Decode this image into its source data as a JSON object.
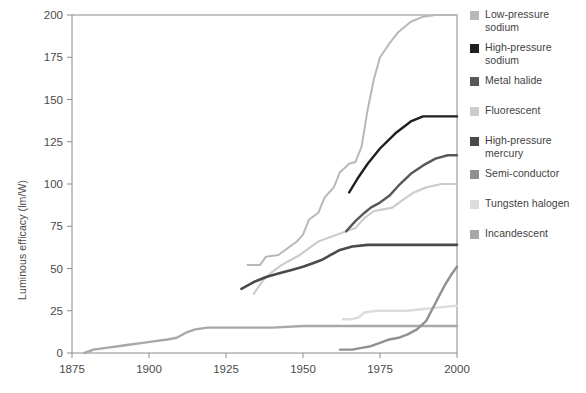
{
  "chart_data": {
    "type": "line",
    "title": "",
    "xlabel": "",
    "ylabel": "Luminous efficacy (lm/W)",
    "xlim": [
      1875,
      2000
    ],
    "ylim": [
      0,
      200
    ],
    "xticks": [
      "1875",
      "1900",
      "1925",
      "1950",
      "1975",
      "2000"
    ],
    "xtick_values": [
      1875,
      1900,
      1925,
      1950,
      1975,
      2000
    ],
    "yticks": [
      "0",
      "25",
      "50",
      "75",
      "100",
      "125",
      "150",
      "175",
      "200"
    ],
    "ytick_values": [
      0,
      25,
      50,
      75,
      100,
      125,
      150,
      175,
      200
    ],
    "grid": false,
    "legend_position": "right",
    "series": [
      {
        "name": "Low-pressure sodium",
        "color": "#b8b8b8",
        "width": 2.0,
        "points": [
          [
            1932,
            52
          ],
          [
            1936,
            52
          ],
          [
            1938,
            57
          ],
          [
            1942,
            58
          ],
          [
            1945,
            62
          ],
          [
            1948,
            66
          ],
          [
            1950,
            70
          ],
          [
            1952,
            79
          ],
          [
            1955,
            83
          ],
          [
            1957,
            92
          ],
          [
            1960,
            98
          ],
          [
            1962,
            107
          ],
          [
            1965,
            112
          ],
          [
            1967,
            113
          ],
          [
            1969,
            122
          ],
          [
            1971,
            144
          ],
          [
            1973,
            162
          ],
          [
            1975,
            175
          ],
          [
            1978,
            183
          ],
          [
            1981,
            190
          ],
          [
            1985,
            196
          ],
          [
            1989,
            199
          ],
          [
            1993,
            200
          ],
          [
            2000,
            200
          ]
        ]
      },
      {
        "name": "High-pressure sodium",
        "color": "#1f1f1f",
        "width": 2.4,
        "points": [
          [
            1965,
            95
          ],
          [
            1968,
            104
          ],
          [
            1971,
            112
          ],
          [
            1975,
            121
          ],
          [
            1980,
            130
          ],
          [
            1985,
            137
          ],
          [
            1989,
            140
          ],
          [
            1993,
            140
          ],
          [
            2000,
            140
          ]
        ]
      },
      {
        "name": "Metal halide",
        "color": "#585858",
        "width": 2.4,
        "points": [
          [
            1964,
            72
          ],
          [
            1967,
            78
          ],
          [
            1970,
            83
          ],
          [
            1972,
            86
          ],
          [
            1975,
            89
          ],
          [
            1978,
            93
          ],
          [
            1981,
            99
          ],
          [
            1985,
            106
          ],
          [
            1989,
            111
          ],
          [
            1993,
            115
          ],
          [
            1997,
            117
          ],
          [
            2000,
            117
          ]
        ]
      },
      {
        "name": "Fluorescent",
        "color": "#cccccc",
        "width": 2.2,
        "points": [
          [
            1934,
            35
          ],
          [
            1937,
            43
          ],
          [
            1940,
            48
          ],
          [
            1943,
            52
          ],
          [
            1946,
            55
          ],
          [
            1949,
            58
          ],
          [
            1952,
            62
          ],
          [
            1955,
            66
          ],
          [
            1958,
            68
          ],
          [
            1961,
            70
          ],
          [
            1964,
            72
          ],
          [
            1967,
            74
          ],
          [
            1970,
            80
          ],
          [
            1973,
            84
          ],
          [
            1976,
            85
          ],
          [
            1979,
            86
          ],
          [
            1982,
            90
          ],
          [
            1986,
            95
          ],
          [
            1990,
            98
          ],
          [
            1995,
            100
          ],
          [
            2000,
            100
          ]
        ]
      },
      {
        "name": "High-pressure mercury",
        "color": "#4a4a4a",
        "width": 2.6,
        "points": [
          [
            1930,
            38
          ],
          [
            1934,
            42
          ],
          [
            1938,
            45
          ],
          [
            1942,
            47
          ],
          [
            1946,
            49
          ],
          [
            1950,
            51
          ],
          [
            1953,
            53
          ],
          [
            1956,
            55
          ],
          [
            1959,
            58
          ],
          [
            1962,
            61
          ],
          [
            1966,
            63
          ],
          [
            1971,
            64
          ],
          [
            1976,
            64
          ],
          [
            1982,
            64
          ],
          [
            1990,
            64
          ],
          [
            2000,
            64
          ]
        ]
      },
      {
        "name": "Semi-conductor",
        "color": "#909090",
        "width": 2.4,
        "points": [
          [
            1962,
            2
          ],
          [
            1966,
            2
          ],
          [
            1969,
            3
          ],
          [
            1972,
            4
          ],
          [
            1975,
            6
          ],
          [
            1978,
            8
          ],
          [
            1981,
            9
          ],
          [
            1984,
            11
          ],
          [
            1987,
            14
          ],
          [
            1990,
            19
          ],
          [
            1992,
            26
          ],
          [
            1994,
            33
          ],
          [
            1996,
            40
          ],
          [
            1998,
            46
          ],
          [
            2000,
            51
          ]
        ]
      },
      {
        "name": "Tungsten halogen",
        "color": "#dcdcdc",
        "width": 2.4,
        "points": [
          [
            1963,
            20
          ],
          [
            1966,
            20
          ],
          [
            1968,
            21
          ],
          [
            1970,
            24
          ],
          [
            1974,
            25
          ],
          [
            1979,
            25
          ],
          [
            1984,
            25
          ],
          [
            1989,
            26
          ],
          [
            1994,
            27
          ],
          [
            2000,
            28
          ]
        ]
      },
      {
        "name": "Incandescent",
        "color": "#a8a8a8",
        "width": 2.4,
        "points": [
          [
            1879,
            0
          ],
          [
            1882,
            2
          ],
          [
            1886,
            3
          ],
          [
            1890,
            4
          ],
          [
            1894,
            5
          ],
          [
            1898,
            6
          ],
          [
            1902,
            7
          ],
          [
            1906,
            8
          ],
          [
            1909,
            9
          ],
          [
            1912,
            12
          ],
          [
            1915,
            14
          ],
          [
            1919,
            15
          ],
          [
            1924,
            15
          ],
          [
            1930,
            15
          ],
          [
            1940,
            15
          ],
          [
            1950,
            16
          ],
          [
            1960,
            16
          ],
          [
            1970,
            16
          ],
          [
            1980,
            16
          ],
          [
            1990,
            16
          ],
          [
            2000,
            16
          ]
        ]
      }
    ]
  },
  "legend": {
    "items": [
      {
        "label": "Low-pressure sodium",
        "color": "#b8b8b8"
      },
      {
        "label": "High-pressure sodium",
        "color": "#1f1f1f"
      },
      {
        "label": "Metal halide",
        "color": "#585858"
      },
      {
        "label": "Fluorescent",
        "color": "#cccccc"
      },
      {
        "label": "High-pressure mercury",
        "color": "#4a4a4a"
      },
      {
        "label": "Semi-conductor",
        "color": "#909090"
      },
      {
        "label": "Tungsten halogen",
        "color": "#dcdcdc"
      },
      {
        "label": "Incandescent",
        "color": "#a8a8a8"
      }
    ]
  },
  "axis_color": "#8a8a8a"
}
